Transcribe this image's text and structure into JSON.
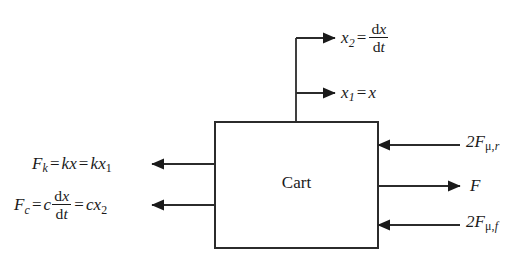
{
  "diagram": {
    "block": {
      "label": "Cart",
      "x": 215,
      "y": 122,
      "width": 163,
      "height": 126,
      "stroke": "#2b2b2b",
      "stroke_width": 2,
      "fill": "#ffffff"
    },
    "background": "#ffffff",
    "line_color": "#2b2b2b",
    "text_color": "#1a1a1a",
    "outputs_top": [
      {
        "name": "velocity-state",
        "lhs": "x",
        "lhs_sub": "2",
        "relation": "=",
        "rhs_kind": "fraction",
        "rhs_numerator_d": "d",
        "rhs_numerator_var": "x",
        "rhs_denominator_d": "d",
        "rhs_denominator_var": "t",
        "arrow_y": 38,
        "arrow_x1": 296,
        "arrow_x2": 335,
        "direction": "right"
      },
      {
        "name": "position-state",
        "lhs": "x",
        "lhs_sub": "1",
        "relation": "=",
        "rhs_kind": "plain",
        "rhs": "x",
        "arrow_y": 93,
        "arrow_x1": 296,
        "arrow_x2": 335,
        "direction": "right"
      }
    ],
    "outputs_left": [
      {
        "name": "spring-force",
        "lhs": "F",
        "lhs_sub": "k",
        "terms": [
          "kx",
          "kx1"
        ],
        "arrow_y": 164,
        "arrow_x1": 215,
        "arrow_x2": 152,
        "direction": "left"
      },
      {
        "name": "damper-force",
        "lhs": "F",
        "lhs_sub": "c",
        "coefficient": "c",
        "rhs_kind": "fraction",
        "rhs_numerator_d": "d",
        "rhs_numerator_var": "x",
        "rhs_denominator_d": "d",
        "rhs_denominator_var": "t",
        "final_term": "cx2",
        "arrow_y": 205,
        "arrow_x1": 215,
        "arrow_x2": 152,
        "direction": "left"
      }
    ],
    "inputs_right": [
      {
        "name": "rear-friction-force",
        "coefficient": "2",
        "symbol": "F",
        "sub_greek": "μ",
        "sub_comma": ",",
        "sub_index": "r",
        "arrow_y": 145,
        "arrow_x1": 460,
        "arrow_x2": 378,
        "direction": "left"
      },
      {
        "name": "drive-force",
        "symbol": "F",
        "arrow_y": 186,
        "arrow_x1": 378,
        "arrow_x2": 460,
        "direction": "right"
      },
      {
        "name": "front-friction-force",
        "coefficient": "2",
        "symbol": "F",
        "sub_greek": "μ",
        "sub_comma": ",",
        "sub_index": "f",
        "arrow_y": 225,
        "arrow_x1": 460,
        "arrow_x2": 378,
        "direction": "left"
      }
    ],
    "stem": {
      "name": "state-output-stem",
      "x": 296,
      "y_top": 38,
      "y_bottom": 122
    }
  }
}
